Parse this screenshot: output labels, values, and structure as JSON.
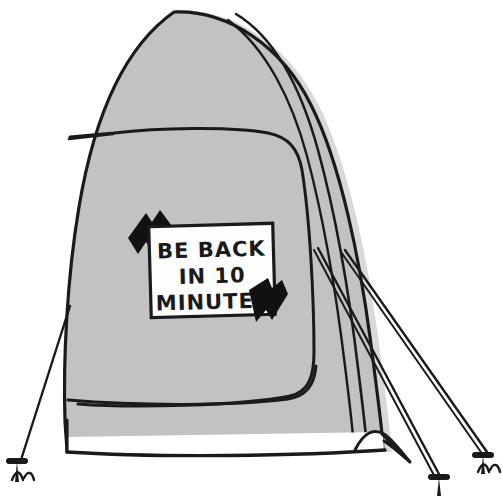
{
  "illustration": {
    "title": "Campsite tent with handwritten note taped to the door",
    "background_color": "#ffffff",
    "ink_color": "#1a1a1a",
    "tent_fill_color": "#c2c2c2",
    "tent_shadow_color": "#d9d9d9",
    "sign_fill_color": "#fdfdfd",
    "tape_color": "#111111"
  },
  "sign": {
    "line1": "BE BACK",
    "line2": "IN 10",
    "line3": "MINUTES",
    "full_text": "BE BACK IN 10 MINUTES",
    "minutes_value": "10"
  },
  "tent": {
    "label": "dome tent",
    "door_panel_label": "tent door panel",
    "side_panel_label": "tent side panel",
    "seam_label": "tent seam",
    "base_label": "tent base",
    "fly_label": "tent rain fly edge"
  },
  "guylines": [
    {
      "name": "left guy line"
    },
    {
      "name": "right upper guy line"
    },
    {
      "name": "right lower guy line"
    }
  ],
  "stakes": [
    {
      "name": "left tent stake"
    },
    {
      "name": "center right tent stake"
    },
    {
      "name": "far right tent stake"
    }
  ],
  "tape_pieces": [
    {
      "name": "top left tape strip"
    },
    {
      "name": "bottom right tape strip"
    }
  ]
}
